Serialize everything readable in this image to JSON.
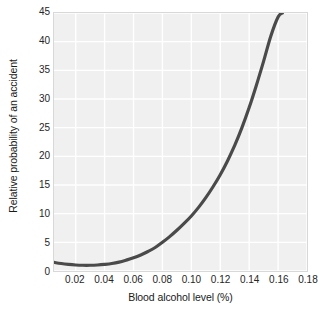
{
  "chart_data": {
    "type": "line",
    "title": "",
    "xlabel": "Blood alcohol level (%)",
    "ylabel": "Relative probability of an accident",
    "xlim": [
      0.005,
      0.18
    ],
    "ylim": [
      0,
      45
    ],
    "grid": true,
    "legend": "none",
    "xticks": [
      "0.02",
      "0.04",
      "0.06",
      "0.08",
      "0.10",
      "0.12",
      "0.14",
      "0.16",
      "0.18"
    ],
    "xtick_values": [
      0.02,
      0.04,
      0.06,
      0.08,
      0.1,
      0.12,
      0.14,
      0.16,
      0.18
    ],
    "yticks": [
      "0",
      "5",
      "10",
      "15",
      "20",
      "25",
      "30",
      "35",
      "40",
      "45"
    ],
    "ytick_values": [
      0,
      5,
      10,
      15,
      20,
      25,
      30,
      35,
      40,
      45
    ],
    "line_color": "#4a4a4a",
    "line_width": 3.2,
    "plot_background": "#f0f0f0",
    "grid_color": "#ffffff",
    "series": [
      {
        "name": "Relative accident probability",
        "x": [
          0.005,
          0.01,
          0.015,
          0.02,
          0.025,
          0.03,
          0.035,
          0.04,
          0.045,
          0.05,
          0.055,
          0.06,
          0.065,
          0.07,
          0.075,
          0.08,
          0.085,
          0.09,
          0.095,
          0.1,
          0.105,
          0.11,
          0.115,
          0.12,
          0.125,
          0.13,
          0.135,
          0.14,
          0.145,
          0.15,
          0.155,
          0.16,
          0.163
        ],
        "y": [
          1.5,
          1.3,
          1.15,
          1.05,
          1.0,
          1.0,
          1.05,
          1.15,
          1.3,
          1.55,
          1.9,
          2.3,
          2.8,
          3.4,
          4.1,
          5.0,
          6.0,
          7.1,
          8.3,
          9.6,
          11.1,
          12.8,
          14.7,
          16.8,
          19.2,
          21.9,
          25.0,
          28.5,
          32.4,
          36.6,
          41.0,
          44.3,
          45.0
        ]
      }
    ]
  },
  "axes": {
    "y_axis_label": "Relative probability of an accident",
    "x_axis_label": "Blood alcohol level (%)"
  }
}
